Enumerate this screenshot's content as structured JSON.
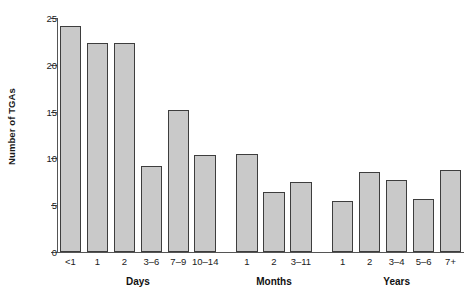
{
  "chart_data": {
    "type": "bar",
    "title": "",
    "xlabel": "",
    "ylabel": "Number of TGAs",
    "ylim": [
      0,
      25
    ],
    "yticks": [
      0,
      5,
      10,
      15,
      20,
      25
    ],
    "ytick_labels": [
      "0",
      "5",
      "10",
      "15",
      "20",
      "25"
    ],
    "grid": false,
    "legend": null,
    "categories": [
      "<1",
      "1",
      "2",
      "3–6",
      "7–9",
      "10–14",
      "1",
      "2",
      "3–11",
      "1",
      "2",
      "3–4",
      "5–6",
      "7+"
    ],
    "values": [
      24.2,
      22.3,
      22.3,
      9.2,
      15.2,
      10.4,
      10.5,
      6.4,
      7.5,
      5.4,
      8.6,
      7.7,
      5.7,
      8.8
    ],
    "groups": [
      {
        "label": "Days",
        "categories": [
          "<1",
          "1",
          "2",
          "3–6",
          "7–9",
          "10–14"
        ],
        "values": [
          24.2,
          22.3,
          22.3,
          9.2,
          15.2,
          10.4
        ]
      },
      {
        "label": "Months",
        "categories": [
          "1",
          "2",
          "3–11"
        ],
        "values": [
          10.5,
          6.4,
          7.5
        ]
      },
      {
        "label": "Years",
        "categories": [
          "1",
          "2",
          "3–4",
          "5–6",
          "7+"
        ],
        "values": [
          5.4,
          8.6,
          7.7,
          5.7,
          8.8
        ]
      }
    ],
    "bar_color": "#c9c9c9",
    "bar_edge_color": "#3d3d3d",
    "axis_color": "#555555"
  }
}
